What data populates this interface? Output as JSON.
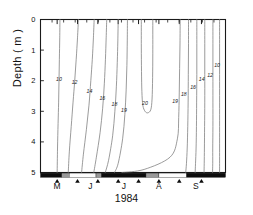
{
  "figure": {
    "axis_label_y": "Depth ( m )",
    "axis_label_x": "1984"
  },
  "chart_data": {
    "type": "line",
    "title": "",
    "subtitle": "",
    "xlabel": "1984",
    "ylabel": "Depth ( m )",
    "grid": false,
    "legend": "none",
    "y_axis": {
      "label": "Depth ( m )",
      "unit": "m",
      "ticks": [
        0,
        1,
        2,
        3,
        4,
        5
      ],
      "tick_labels": [
        "0",
        "1",
        "2",
        "3",
        "4",
        "5"
      ],
      "ylim": [
        0,
        5
      ],
      "inverted": true
    },
    "x_axis": {
      "label": "1984",
      "tick_labels": [
        "M",
        "J",
        "J",
        "A",
        "S"
      ],
      "tick_positions_frac": [
        0.09,
        0.27,
        0.45,
        0.64,
        0.84
      ],
      "marker_positions_frac": [
        0.09,
        0.2,
        0.31,
        0.42,
        0.53,
        0.64,
        0.75,
        0.87
      ],
      "marker_glyph": "triangle-up",
      "sampling_bar": [
        {
          "start_frac": 0.0,
          "end_frac": 0.115,
          "shade": "black"
        },
        {
          "start_frac": 0.115,
          "end_frac": 0.155,
          "shade": "gray"
        },
        {
          "start_frac": 0.155,
          "end_frac": 0.3,
          "shade": "white"
        },
        {
          "start_frac": 0.3,
          "end_frac": 0.33,
          "shade": "gray"
        },
        {
          "start_frac": 0.33,
          "end_frac": 0.57,
          "shade": "black"
        },
        {
          "start_frac": 0.57,
          "end_frac": 0.64,
          "shade": "gray"
        },
        {
          "start_frac": 0.64,
          "end_frac": 0.79,
          "shade": "white"
        },
        {
          "start_frac": 0.79,
          "end_frac": 1.0,
          "shade": "black"
        }
      ]
    },
    "contours": [
      {
        "level": 10,
        "label": "10",
        "label_x_frac": 0.1,
        "label_depth": 1.95,
        "path": [
          [
            0.105,
            0.0
          ],
          [
            0.104,
            0.6
          ],
          [
            0.102,
            1.3
          ],
          [
            0.1,
            2.0
          ],
          [
            0.098,
            2.7
          ],
          [
            0.095,
            3.4
          ],
          [
            0.092,
            4.2
          ],
          [
            0.09,
            5.0
          ]
        ]
      },
      {
        "level": 12,
        "label": "12",
        "label_x_frac": 0.185,
        "label_depth": 2.05,
        "path": [
          [
            0.205,
            0.0
          ],
          [
            0.2,
            0.6
          ],
          [
            0.193,
            1.3
          ],
          [
            0.185,
            2.0
          ],
          [
            0.176,
            2.7
          ],
          [
            0.166,
            3.5
          ],
          [
            0.156,
            4.3
          ],
          [
            0.15,
            5.0
          ]
        ]
      },
      {
        "level": 14,
        "label": "14",
        "label_x_frac": 0.265,
        "label_depth": 2.35,
        "path": [
          [
            0.29,
            0.0
          ],
          [
            0.286,
            0.6
          ],
          [
            0.28,
            1.3
          ],
          [
            0.272,
            2.0
          ],
          [
            0.262,
            2.8
          ],
          [
            0.248,
            3.6
          ],
          [
            0.232,
            4.4
          ],
          [
            0.222,
            5.0
          ]
        ]
      },
      {
        "level": 16,
        "label": "16",
        "label_x_frac": 0.335,
        "label_depth": 2.55,
        "path": [
          [
            0.358,
            0.0
          ],
          [
            0.355,
            0.6
          ],
          [
            0.351,
            1.3
          ],
          [
            0.345,
            2.1
          ],
          [
            0.336,
            2.9
          ],
          [
            0.322,
            3.7
          ],
          [
            0.302,
            4.5
          ],
          [
            0.288,
            5.0
          ]
        ]
      },
      {
        "level": 18,
        "label": "18",
        "label_x_frac": 0.4,
        "label_depth": 2.75,
        "path": [
          [
            0.42,
            0.0
          ],
          [
            0.418,
            0.7
          ],
          [
            0.415,
            1.4
          ],
          [
            0.41,
            2.2
          ],
          [
            0.402,
            3.0
          ],
          [
            0.39,
            3.8
          ],
          [
            0.368,
            4.6
          ],
          [
            0.35,
            5.0
          ]
        ]
      },
      {
        "level": 19,
        "label": "19",
        "label_x_frac": 0.452,
        "label_depth": 2.95,
        "path": [
          [
            0.47,
            0.0
          ],
          [
            0.469,
            0.7
          ],
          [
            0.467,
            1.5
          ],
          [
            0.463,
            2.3
          ],
          [
            0.456,
            3.1
          ],
          [
            0.444,
            3.9
          ],
          [
            0.42,
            4.7
          ],
          [
            0.4,
            5.0
          ]
        ]
      },
      {
        "level": 20,
        "label": "20",
        "label_x_frac": 0.565,
        "label_depth": 2.72,
        "closed": true,
        "path": [
          [
            0.545,
            0.0
          ],
          [
            0.545,
            0.9
          ],
          [
            0.546,
            1.7
          ],
          [
            0.548,
            2.35
          ],
          [
            0.553,
            2.8
          ],
          [
            0.565,
            3.0
          ],
          [
            0.58,
            3.05
          ],
          [
            0.596,
            2.95
          ],
          [
            0.603,
            2.6
          ],
          [
            0.606,
            1.9
          ],
          [
            0.607,
            1.1
          ],
          [
            0.607,
            0.0
          ]
        ]
      },
      {
        "level": 19,
        "label": "19",
        "label_x_frac": 0.728,
        "label_depth": 2.65,
        "path": [
          [
            0.755,
            0.0
          ],
          [
            0.754,
            0.8
          ],
          [
            0.752,
            1.6
          ],
          [
            0.75,
            2.4
          ],
          [
            0.747,
            3.2
          ],
          [
            0.74,
            3.9
          ],
          [
            0.7,
            4.5
          ],
          [
            0.56,
            4.9
          ],
          [
            0.44,
            5.0
          ]
        ]
      },
      {
        "level": 18,
        "label": "18",
        "label_x_frac": 0.775,
        "label_depth": 2.45,
        "path": [
          [
            0.8,
            0.0
          ],
          [
            0.8,
            0.9
          ],
          [
            0.799,
            1.8
          ],
          [
            0.798,
            2.7
          ],
          [
            0.796,
            3.5
          ],
          [
            0.793,
            4.2
          ],
          [
            0.789,
            4.7
          ],
          [
            0.785,
            5.0
          ]
        ]
      },
      {
        "level": 16,
        "label": "16",
        "label_x_frac": 0.825,
        "label_depth": 2.2,
        "path": [
          [
            0.845,
            0.0
          ],
          [
            0.845,
            0.9
          ],
          [
            0.845,
            1.8
          ],
          [
            0.844,
            2.7
          ],
          [
            0.843,
            3.5
          ],
          [
            0.841,
            4.2
          ],
          [
            0.838,
            4.7
          ],
          [
            0.836,
            5.0
          ]
        ]
      },
      {
        "level": 14,
        "label": "14",
        "label_x_frac": 0.872,
        "label_depth": 1.95,
        "path": [
          [
            0.888,
            0.0
          ],
          [
            0.888,
            0.9
          ],
          [
            0.888,
            1.8
          ],
          [
            0.888,
            2.7
          ],
          [
            0.887,
            3.5
          ],
          [
            0.886,
            4.2
          ],
          [
            0.885,
            4.7
          ],
          [
            0.884,
            5.0
          ]
        ]
      },
      {
        "level": 12,
        "label": "12",
        "label_x_frac": 0.917,
        "label_depth": 1.8,
        "path": [
          [
            0.932,
            0.0
          ],
          [
            0.932,
            0.9
          ],
          [
            0.932,
            1.8
          ],
          [
            0.932,
            2.7
          ],
          [
            0.932,
            3.5
          ],
          [
            0.931,
            4.2
          ],
          [
            0.931,
            4.7
          ],
          [
            0.93,
            5.0
          ]
        ]
      },
      {
        "level": 10,
        "label": "10",
        "label_x_frac": 0.955,
        "label_depth": 1.5,
        "path": [
          [
            0.968,
            0.0
          ],
          [
            0.968,
            0.9
          ],
          [
            0.968,
            1.8
          ],
          [
            0.968,
            2.7
          ],
          [
            0.968,
            3.5
          ],
          [
            0.968,
            4.2
          ],
          [
            0.968,
            4.7
          ],
          [
            0.968,
            5.0
          ]
        ]
      }
    ],
    "note": "Isotherm (temperature, deg C) contours of depth vs time, May-September 1984"
  }
}
